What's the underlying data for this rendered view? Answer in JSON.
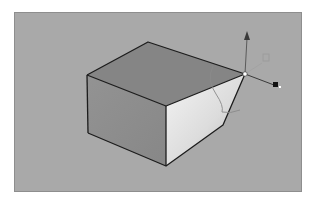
{
  "viewport": {
    "background": "#a9a9a9",
    "border": "#8e8e8e"
  },
  "model": {
    "type": "box",
    "faces": {
      "top": "#858585",
      "left": "#8f8f8f",
      "right_gradient": [
        "#f2f2f2",
        "#b8b8b8"
      ]
    },
    "edge_color": "#1c1c1c",
    "selected_vertex": {
      "x": 245,
      "y": 74
    }
  },
  "gizmo": {
    "axes": [
      "y-up-arrow",
      "x-right-arrow",
      "z-depth-line"
    ],
    "plane_handle": "xy-plane-square",
    "rotation_arc": true
  }
}
